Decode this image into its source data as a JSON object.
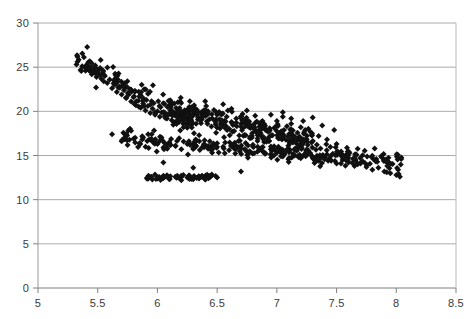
{
  "chart_data": {
    "type": "scatter",
    "title": "",
    "subtitle": "",
    "xlabel": "",
    "ylabel": "",
    "xlim": [
      5,
      8.5
    ],
    "ylim": [
      0,
      30
    ],
    "grid": true,
    "grid_axis": "y",
    "legend": false,
    "legend_position": "none",
    "marker": "diamond",
    "marker_size_px": 3,
    "series_color": "#111111",
    "axis_color": "#808080",
    "grid_color": "#aaaaaa",
    "x_ticks": [
      5,
      5.5,
      6,
      6.5,
      7,
      7.5,
      8,
      8.5
    ],
    "x_tick_labels": [
      "5",
      "5.5",
      "6",
      "6.5",
      "7",
      "7.5",
      "8",
      "8.5"
    ],
    "y_ticks": [
      0,
      5,
      10,
      15,
      20,
      25,
      30
    ],
    "y_tick_labels": [
      "0",
      "5",
      "10",
      "15",
      "20",
      "25",
      "30"
    ],
    "n_points": 720,
    "clusters": [
      {
        "name": "upper-steep-band",
        "x_range": [
          5.32,
          6.3
        ],
        "y_range": [
          18.5,
          25.8
        ],
        "n": 120,
        "trend": "steep-decline"
      },
      {
        "name": "mid-dense-core",
        "x_range": [
          6.0,
          7.3
        ],
        "y_range": [
          14.0,
          21.0
        ],
        "n": 260,
        "trend": "gentle-decline"
      },
      {
        "name": "lower-main-band",
        "x_range": [
          5.7,
          8.05
        ],
        "y_range": [
          12.3,
          17.5
        ],
        "n": 280,
        "trend": "gentle-decline"
      },
      {
        "name": "low-left-clump",
        "x_range": [
          5.9,
          6.5
        ],
        "y_range": [
          11.8,
          13.3
        ],
        "n": 60,
        "trend": "flat"
      }
    ],
    "series": [
      {
        "name": "observations",
        "color": "#111111",
        "points": [
          [
            5.33,
            25.6
          ],
          [
            5.37,
            25.1
          ],
          [
            5.4,
            24.9
          ],
          [
            5.41,
            25.3
          ],
          [
            5.43,
            24.6
          ],
          [
            5.44,
            25.0
          ],
          [
            5.45,
            24.2
          ],
          [
            5.46,
            24.8
          ],
          [
            5.47,
            24.4
          ],
          [
            5.48,
            25.2
          ],
          [
            5.49,
            23.9
          ],
          [
            5.5,
            24.6
          ],
          [
            5.51,
            24.1
          ],
          [
            5.52,
            24.9
          ],
          [
            5.53,
            23.7
          ],
          [
            5.54,
            24.3
          ],
          [
            5.55,
            23.4
          ],
          [
            5.56,
            24.0
          ],
          [
            5.58,
            23.2
          ],
          [
            5.6,
            23.6
          ],
          [
            5.62,
            22.6
          ],
          [
            5.64,
            23.0
          ],
          [
            5.66,
            22.2
          ],
          [
            5.68,
            22.8
          ],
          [
            5.7,
            21.9
          ],
          [
            5.72,
            22.4
          ],
          [
            5.74,
            21.5
          ],
          [
            5.76,
            21.9
          ],
          [
            5.78,
            21.1
          ],
          [
            5.8,
            21.6
          ],
          [
            5.82,
            20.7
          ],
          [
            5.84,
            21.2
          ],
          [
            5.86,
            20.4
          ],
          [
            5.88,
            20.9
          ],
          [
            5.9,
            20.1
          ],
          [
            5.92,
            20.6
          ],
          [
            5.94,
            19.8
          ],
          [
            5.96,
            20.3
          ],
          [
            5.98,
            19.6
          ],
          [
            6.0,
            20.0
          ],
          [
            6.02,
            19.4
          ],
          [
            6.05,
            19.9
          ],
          [
            6.08,
            19.2
          ],
          [
            6.1,
            19.7
          ],
          [
            6.12,
            19.0
          ],
          [
            6.15,
            19.5
          ],
          [
            6.18,
            18.8
          ],
          [
            6.2,
            19.3
          ],
          [
            6.24,
            18.6
          ],
          [
            6.28,
            19.1
          ],
          [
            6.3,
            19.6
          ],
          [
            6.34,
            19.9
          ],
          [
            6.38,
            19.4
          ],
          [
            6.42,
            19.8
          ],
          [
            6.46,
            19.2
          ],
          [
            6.5,
            19.6
          ],
          [
            6.54,
            19.0
          ],
          [
            6.58,
            19.4
          ],
          [
            6.62,
            18.8
          ],
          [
            6.66,
            19.2
          ],
          [
            6.7,
            18.6
          ],
          [
            6.74,
            19.0
          ],
          [
            6.78,
            18.3
          ],
          [
            6.82,
            18.7
          ],
          [
            6.86,
            18.0
          ],
          [
            6.9,
            18.4
          ],
          [
            6.94,
            17.8
          ],
          [
            6.98,
            18.1
          ],
          [
            7.02,
            17.5
          ],
          [
            7.06,
            17.9
          ],
          [
            5.7,
            16.6
          ],
          [
            5.75,
            16.2
          ],
          [
            5.8,
            16.9
          ],
          [
            5.85,
            16.4
          ],
          [
            5.9,
            16.0
          ],
          [
            5.95,
            16.7
          ],
          [
            6.0,
            16.3
          ],
          [
            6.05,
            15.9
          ],
          [
            6.1,
            16.5
          ],
          [
            6.15,
            16.1
          ],
          [
            6.2,
            15.7
          ],
          [
            6.25,
            16.3
          ],
          [
            6.3,
            15.9
          ],
          [
            6.35,
            16.6
          ],
          [
            6.4,
            16.2
          ],
          [
            6.45,
            15.8
          ],
          [
            6.5,
            16.4
          ],
          [
            6.55,
            16.0
          ],
          [
            6.6,
            15.6
          ],
          [
            6.65,
            16.2
          ],
          [
            6.7,
            15.8
          ],
          [
            6.75,
            15.4
          ],
          [
            6.8,
            16.0
          ],
          [
            6.85,
            15.6
          ],
          [
            6.9,
            15.2
          ],
          [
            6.95,
            15.7
          ],
          [
            7.0,
            15.3
          ],
          [
            7.05,
            14.9
          ],
          [
            7.1,
            15.4
          ],
          [
            7.15,
            15.0
          ],
          [
            7.2,
            14.7
          ],
          [
            7.25,
            15.1
          ],
          [
            7.3,
            14.8
          ],
          [
            7.35,
            14.4
          ],
          [
            7.4,
            14.8
          ],
          [
            7.45,
            14.5
          ],
          [
            7.5,
            14.1
          ],
          [
            7.55,
            14.5
          ],
          [
            7.6,
            14.2
          ],
          [
            7.65,
            13.8
          ],
          [
            7.7,
            14.1
          ],
          [
            7.75,
            13.7
          ],
          [
            7.8,
            13.4
          ],
          [
            7.85,
            13.6
          ],
          [
            7.9,
            13.2
          ],
          [
            7.95,
            13.0
          ],
          [
            8.0,
            12.8
          ],
          [
            8.03,
            12.6
          ],
          [
            5.95,
            12.6
          ],
          [
            6.0,
            12.4
          ],
          [
            6.05,
            12.7
          ],
          [
            6.1,
            12.3
          ],
          [
            6.15,
            12.6
          ],
          [
            6.2,
            12.2
          ],
          [
            6.25,
            12.5
          ],
          [
            6.3,
            12.3
          ],
          [
            6.35,
            12.6
          ],
          [
            6.4,
            12.4
          ],
          [
            6.45,
            12.7
          ],
          [
            6.5,
            12.5
          ],
          [
            7.0,
            18.9
          ],
          [
            7.05,
            19.4
          ],
          [
            7.12,
            18.6
          ],
          [
            7.2,
            18.2
          ],
          [
            7.28,
            17.7
          ],
          [
            7.35,
            17.2
          ],
          [
            7.42,
            16.8
          ],
          [
            7.5,
            16.3
          ]
        ]
      }
    ]
  },
  "plot_geometry": {
    "left_px": 38,
    "right_px": 456,
    "top_px": 23,
    "bottom_px": 288
  }
}
